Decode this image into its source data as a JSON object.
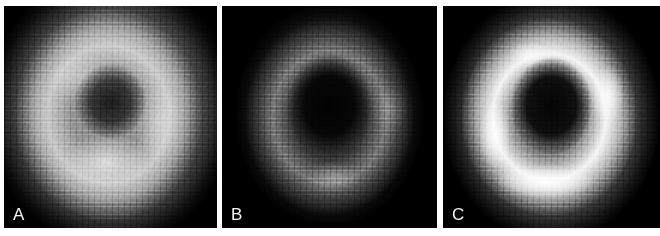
{
  "figure": {
    "kind": "three-panel grayscale tomographic image figure",
    "colormap": "grayscale",
    "background_color": "#ffffff",
    "panel_background_color": "#000000",
    "label_color": "#f2f2f2",
    "panels": [
      {
        "label": "A",
        "description": "Broad uniformly bright mid-gray myocardial blob with a faint darker central cavity",
        "ring_brightness": "moderate",
        "cavity_brightness": "dark-gray",
        "peak_gray_hex": "#c4c4c4",
        "background_gray_hex": "#000000"
      },
      {
        "label": "B",
        "description": "Faint dim gray ring on black with a very dark central cavity",
        "ring_brightness": "low",
        "cavity_brightness": "near-black",
        "peak_gray_hex": "#787878",
        "background_gray_hex": "#000000"
      },
      {
        "label": "C",
        "description": "Very bright ring, brightest along the inferior wall, with a dark central cavity",
        "ring_brightness": "high",
        "cavity_brightness": "near-black",
        "peak_gray_hex": "#ffffff",
        "background_gray_hex": "#000000"
      }
    ]
  }
}
